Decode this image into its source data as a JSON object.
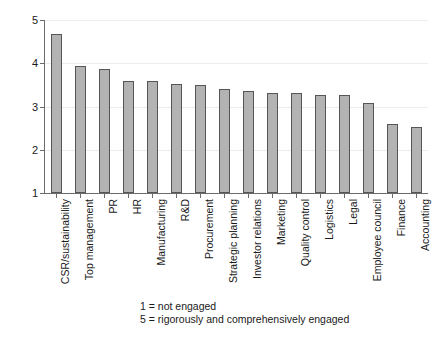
{
  "chart_data": {
    "type": "bar",
    "title": "",
    "xlabel": "",
    "ylabel": "Mean",
    "ylim": [
      1,
      5
    ],
    "yticks": [
      1,
      2,
      3,
      4,
      5
    ],
    "ytick_labels": [
      "1",
      "2",
      "3",
      "4",
      "5"
    ],
    "grid": true,
    "legend": "none",
    "orientation": "vertical",
    "bar_color": "#b3b3b3",
    "bar_edge_color": "#555555",
    "grid_color": "#ececec",
    "axis_color": "#6b6b6b",
    "categories": [
      "CSR/sustainability",
      "Top management",
      "PR",
      "HR",
      "Manufacturing",
      "R&D",
      "Procurement",
      "Strategic planning",
      "Investor relations",
      "Marketing",
      "Quality control",
      "Logistics",
      "Legal",
      "Employee council",
      "Finance",
      "Accounting"
    ],
    "values": [
      4.68,
      3.93,
      3.87,
      3.58,
      3.58,
      3.52,
      3.5,
      3.4,
      3.35,
      3.32,
      3.31,
      3.27,
      3.26,
      3.08,
      2.6,
      2.52
    ],
    "annotations": [
      "1 = not engaged",
      "5 = rigorously and comprehensively engaged"
    ]
  },
  "caption": {
    "line1": "1 = not engaged",
    "line2": "5 = rigorously and comprehensively engaged"
  }
}
